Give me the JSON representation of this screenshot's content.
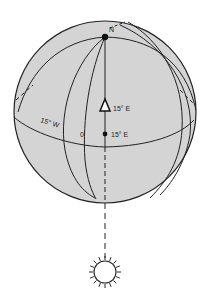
{
  "diagram": {
    "colors": {
      "globe_fill": "#d4d4d4",
      "line": "#222222",
      "background": "#ffffff"
    },
    "labels": {
      "north_pole": "N",
      "triangle_marker": "15° E",
      "dot_marker": "15° E",
      "west_meridian": "15° W",
      "prime_meridian": "0"
    },
    "icons": {
      "sun": "sun-icon",
      "north_pole_dot": "pole-dot-icon",
      "observer_triangle": "triangle-marker-icon"
    }
  }
}
